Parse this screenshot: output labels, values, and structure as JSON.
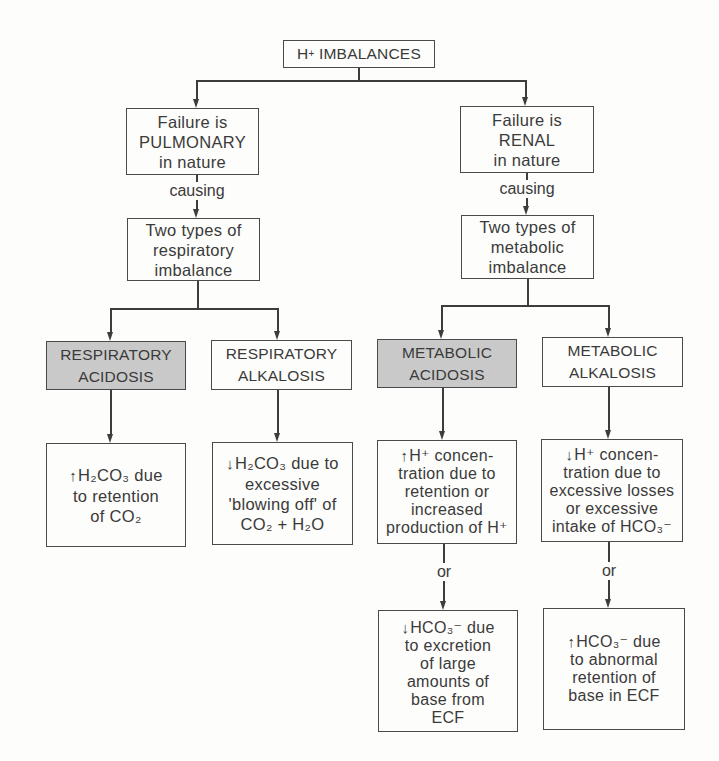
{
  "diagram": {
    "root": {
      "text": "H",
      "sup": "+",
      "text2": " IMBALANCES"
    },
    "branches": [
      {
        "id": "pulmonary",
        "failure": [
          "Failure is",
          "PULMONARY",
          "in nature"
        ],
        "connector": "causing",
        "types": [
          "Two types of",
          "respiratory",
          "imbalance"
        ],
        "children": [
          {
            "id": "respiratory-acidosis",
            "title": [
              "RESPIRATORY",
              "ACIDOSIS"
            ],
            "shaded": true,
            "causes": [
              {
                "arrow": "up",
                "lines": [
                  "H₂CO₃ due",
                  "to retention",
                  "of CO₂"
                ]
              }
            ]
          },
          {
            "id": "respiratory-alkalosis",
            "title": [
              "RESPIRATORY",
              "ALKALOSIS"
            ],
            "shaded": false,
            "causes": [
              {
                "arrow": "down",
                "lines": [
                  "H₂CO₃ due to",
                  "excessive",
                  "'blowing off' of",
                  "CO₂ + H₂O"
                ]
              }
            ]
          }
        ]
      },
      {
        "id": "renal",
        "failure": [
          "Failure is",
          "RENAL",
          "in nature"
        ],
        "connector": "causing",
        "types": [
          "Two types of",
          "metabolic",
          "imbalance"
        ],
        "children": [
          {
            "id": "metabolic-acidosis",
            "title": [
              "METABOLIC",
              "ACIDOSIS"
            ],
            "shaded": true,
            "or_label": "or",
            "causes": [
              {
                "arrow": "up",
                "lines": [
                  "H⁺ concen-",
                  "tration due to",
                  "retention or",
                  "increased",
                  "production of H⁺"
                ]
              },
              {
                "arrow": "down",
                "lines": [
                  "HCO₃⁻ due",
                  "to excretion",
                  "of large",
                  "amounts of",
                  "base from",
                  "ECF"
                ]
              }
            ]
          },
          {
            "id": "metabolic-alkalosis",
            "title": [
              "METABOLIC",
              "ALKALOSIS"
            ],
            "shaded": false,
            "or_label": "or",
            "causes": [
              {
                "arrow": "down",
                "lines": [
                  "H⁺ concen-",
                  "tration due to",
                  "excessive losses",
                  "or excessive",
                  "intake of HCO₃⁻"
                ]
              },
              {
                "arrow": "up",
                "lines": [
                  "HCO₃⁻ due",
                  "to abnormal",
                  "retention of",
                  "base in ECF"
                ]
              }
            ]
          }
        ]
      }
    ],
    "colors": {
      "line": "#3d3d3d",
      "shaded_fill": "#c9c9c9",
      "background": "#fdfdfb",
      "text": "#3a3a3a"
    }
  }
}
